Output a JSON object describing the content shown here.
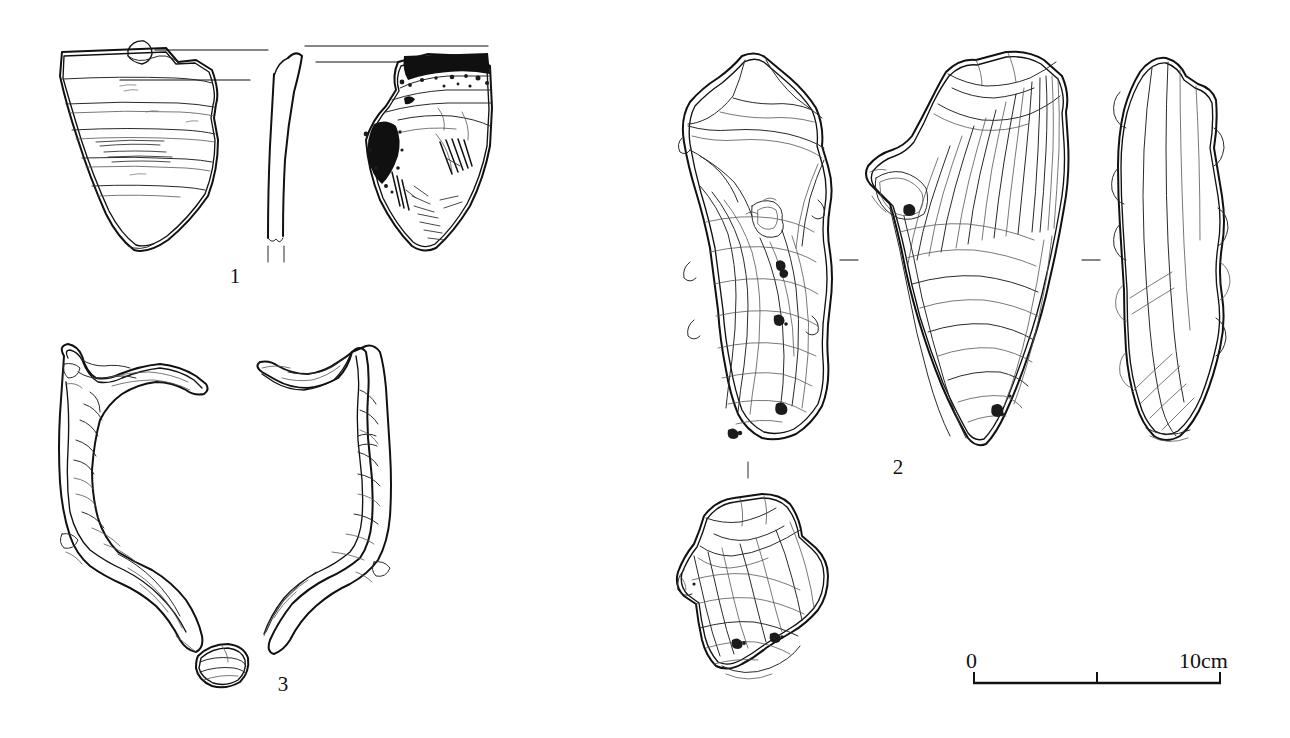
{
  "figure": {
    "type": "archaeological-artifact-plate",
    "background_color": "#ffffff",
    "ink_color": "#111111",
    "width": 1290,
    "height": 738,
    "caption_labels": [
      "1",
      "2",
      "3"
    ]
  },
  "items": [
    {
      "number": "1",
      "label": "1",
      "name": "pottery-sherd",
      "description": "Ceramic rim sherd shown in three views",
      "views": [
        {
          "name": "exterior-view",
          "features": "horizontal cord/comb banding lines"
        },
        {
          "name": "section-profile",
          "features": "thin curved wall cross-section"
        },
        {
          "name": "interior-view",
          "features": "dark carbonised deposit along rim and left body, diagonal scraping striations"
        }
      ],
      "label_x": 235,
      "label_y": 283
    },
    {
      "number": "2",
      "label": "2",
      "name": "lithic-core-tool",
      "description": "Flaked stone tool shown in four views with flake scars and ripple marks",
      "views": [
        {
          "name": "dorsal-view",
          "features": "large flake scars, cortex remnant, impact points"
        },
        {
          "name": "ventral-view",
          "features": "radiating ripples from striking platform"
        },
        {
          "name": "lateral-profile-view",
          "features": "narrow side profile with edge retouch"
        },
        {
          "name": "refit-fragment-view",
          "features": "detached fragment with matching scars"
        }
      ],
      "label_x": 898,
      "label_y": 474
    },
    {
      "number": "3",
      "label": "3",
      "name": "bone-antler-artifact",
      "description": "Worked bone/antler element, two opposing halves plus small section detail",
      "views": [
        {
          "name": "left-half-view",
          "features": "curved tine with worked facets"
        },
        {
          "name": "right-half-view",
          "features": "mirrored curved tine"
        },
        {
          "name": "section-detail-view",
          "features": "small oval cross-section"
        }
      ],
      "label_x": 283,
      "label_y": 691
    }
  ],
  "scale_bar": {
    "name": "scale-bar",
    "start_label": "0",
    "end_label": "10cm",
    "total_cm": 10,
    "ticks_cm": [
      0,
      5,
      10
    ],
    "x_start": 973,
    "x_end": 1221,
    "y": 683
  },
  "separators": [
    {
      "name": "view-separator-dash-left",
      "x": 848,
      "y": 260
    },
    {
      "name": "view-separator-dash-right",
      "x": 1091,
      "y": 260
    },
    {
      "name": "view-tick-lower",
      "x": 748,
      "y": 470
    }
  ]
}
